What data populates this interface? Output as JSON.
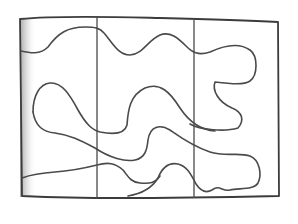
{
  "drawing": {
    "description": "Hand-drawn pencil sketch of a rectangle divided into three vertical panels with wavy, puzzle-like curves running across",
    "panel_count": 3,
    "colors": {
      "background": "#ffffff",
      "line": "#4a4a4a",
      "shading": "#9a9a9a"
    }
  }
}
